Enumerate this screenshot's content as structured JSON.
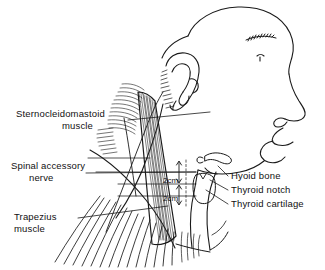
{
  "figure": {
    "background_color": "#ffffff",
    "line_color": "#1a1a1a",
    "labels": {
      "sternocleidomastoid_line1": "Sternocleidomastoid",
      "sternocleidomastoid_line2": "muscle",
      "spinal_accessory_line1": "Spinal accessory",
      "spinal_accessory_line2": "nerve",
      "trapezius_line1": "Trapezius",
      "trapezius_line2": "muscle",
      "hyoid_bone": "Hyoid bone",
      "thyroid_notch": "Thyroid notch",
      "thyroid_cartilage": "Thyroid cartilage"
    },
    "measurements": {
      "upper": "2cm",
      "lower": "2cm"
    }
  }
}
